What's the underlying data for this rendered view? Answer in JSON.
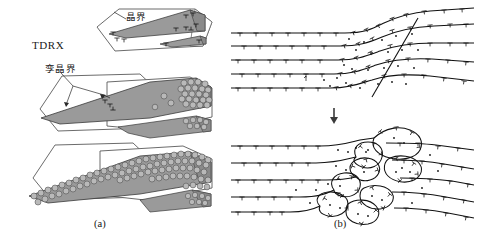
{
  "figure": {
    "title_caption": "",
    "panels": [
      {
        "id": "a",
        "label": "(a)",
        "description": "TDRX hexagonal grain schematic series"
      },
      {
        "id": "b",
        "label": "(b)",
        "description": "Dislocation wall / subgrain evolution schematic"
      }
    ],
    "annotations": {
      "tdrx": "TDRX",
      "grain_boundary": "晶界",
      "twin_boundary": "孪晶界"
    },
    "icons": {
      "down_arrow": "⇩",
      "dislocation": "⊥"
    },
    "colors": {
      "wedge_fill": "#9a9a9a",
      "wedge_fill_dark": "#8e8e8e",
      "grain_fill": "#b4b4b4",
      "outline": "#3a3a3a",
      "hexagon_outline": "#555555",
      "line": "#111111",
      "text": "#1b1b1b",
      "background": "#ffffff"
    },
    "panel_a": {
      "stages": [
        {
          "index": 1,
          "name": "stage-initial",
          "grains": 0,
          "note": "wedge twin, no recrystallized grains"
        },
        {
          "index": 2,
          "name": "stage-nucleation",
          "grains": 34,
          "note": "grains nucleating along boundary"
        },
        {
          "index": 3,
          "name": "stage-growth",
          "grains": 86,
          "note": "wedge fully decorated with grains"
        }
      ]
    },
    "panel_b": {
      "stages": [
        {
          "index": 1,
          "name": "stage-dislocation-pileup",
          "rows": 5,
          "note": "dislocation rows bending at shear band"
        },
        {
          "index": 2,
          "name": "stage-subgrain-formation",
          "rows": 5,
          "note": "closed subgrain cells formed"
        }
      ],
      "row_count": 5
    }
  }
}
